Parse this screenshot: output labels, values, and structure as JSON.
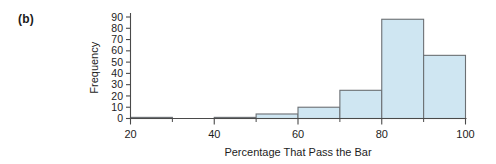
{
  "figure": {
    "panel_label": "(b)",
    "background_color": "#ffffff"
  },
  "chart_data": {
    "type": "bar",
    "title": "",
    "subtitle": "",
    "xlabel": "Percentage That Pass the Bar",
    "ylabel": "Frequency",
    "xlim": [
      20,
      100
    ],
    "ylim": [
      0,
      93
    ],
    "grid": false,
    "legend": "none",
    "bar_fill_color": "#cfe6f2",
    "bar_edge_color": "#6b6f73",
    "axis_color": "#4a4a4a",
    "bin_width": 10,
    "bin_edges": [
      20,
      30,
      30,
      40,
      40,
      50,
      50,
      60,
      60,
      70,
      70,
      80,
      80,
      90,
      90,
      100
    ],
    "categories": [
      "20-30",
      "30-40",
      "40-50",
      "50-60",
      "60-70",
      "70-80",
      "80-90",
      "90-100"
    ],
    "bins": [
      {
        "start": 20,
        "end": 30,
        "value": 1
      },
      {
        "start": 30,
        "end": 40,
        "value": 0
      },
      {
        "start": 40,
        "end": 50,
        "value": 1
      },
      {
        "start": 50,
        "end": 60,
        "value": 4
      },
      {
        "start": 60,
        "end": 70,
        "value": 10
      },
      {
        "start": 70,
        "end": 80,
        "value": 25
      },
      {
        "start": 80,
        "end": 90,
        "value": 88
      },
      {
        "start": 90,
        "end": 100,
        "value": 56
      }
    ],
    "values": [
      1,
      0,
      1,
      4,
      10,
      25,
      88,
      56
    ],
    "yticks": [
      0,
      10,
      20,
      30,
      40,
      50,
      60,
      70,
      80,
      90
    ],
    "ytick_labels": [
      "0",
      "10",
      "20",
      "30",
      "40",
      "50",
      "60",
      "70",
      "80",
      "90"
    ],
    "xticks": [
      20,
      40,
      60,
      80,
      100
    ],
    "xtick_labels": [
      "20",
      "40",
      "60",
      "80",
      "100"
    ],
    "x_minor_ticks": [
      30,
      50,
      70,
      90
    ]
  }
}
